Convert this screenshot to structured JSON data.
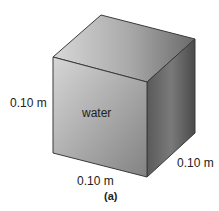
{
  "figure": {
    "header_text_cut": "MASS: RHO × V",
    "object": "cube",
    "contents_label": "water",
    "dimensions": {
      "height_label": "0.10 m",
      "depth_label": "0.10 m",
      "width_label": "0.10 m"
    },
    "caption": "(a)"
  },
  "colors": {
    "edge": "#3a3a3a",
    "front_light": "#d2d2d2",
    "front_dark": "#8a8a8a",
    "top_light": "#d4d4d4",
    "top_dark": "#6e6e6e",
    "side_light": "#8c8c8c",
    "side_dark": "#4a4a4a"
  }
}
